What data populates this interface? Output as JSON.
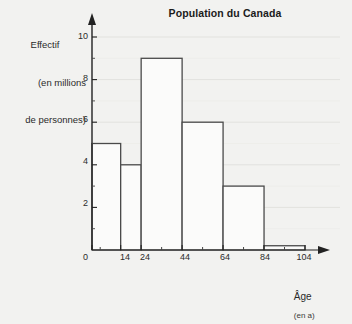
{
  "chart_data": {
    "type": "bar",
    "title": "Population du Canada",
    "xlabel": "Âge",
    "xlabel_unit": "(en a)",
    "ylabel_line1": "Effectif",
    "ylabel_line2": "(en millions",
    "ylabel_line3": "de personnes)",
    "categories": [
      "0-14",
      "14-24",
      "24-44",
      "44-64",
      "64-84",
      "84-104"
    ],
    "bin_edges": [
      0,
      14,
      24,
      44,
      64,
      84,
      104
    ],
    "values": [
      5,
      4,
      9,
      6,
      3,
      0.2
    ],
    "xlim": [
      0,
      104
    ],
    "ylim": [
      0,
      10
    ],
    "xticks": [
      0,
      14,
      24,
      44,
      64,
      84,
      104
    ],
    "xtick_labels": [
      "0",
      "14",
      "24",
      "44",
      "64",
      "84",
      "104"
    ],
    "yticks": [
      0,
      2,
      4,
      6,
      8,
      10
    ],
    "ytick_labels": [
      "0",
      "2",
      "4",
      "6",
      "8",
      "10"
    ],
    "y_minor_ticks": [
      1,
      3,
      5,
      7,
      9
    ],
    "grid": true,
    "legend": false,
    "axis_arrows": true,
    "bar_fill": "#fbfbfa",
    "bar_stroke": "#4a4a4a",
    "grid_color": "#e2e2de",
    "axis_color": "#222222",
    "background": "#f2f2f0"
  },
  "ticks": {
    "y": [
      {
        "label": "10"
      },
      {
        "label": "8"
      },
      {
        "label": "6"
      },
      {
        "label": "4"
      },
      {
        "label": "2"
      },
      {
        "label": "0"
      }
    ],
    "x": [
      {
        "label": "14"
      },
      {
        "label": "24"
      },
      {
        "label": "44"
      },
      {
        "label": "64"
      },
      {
        "label": "84"
      },
      {
        "label": "104"
      }
    ]
  }
}
